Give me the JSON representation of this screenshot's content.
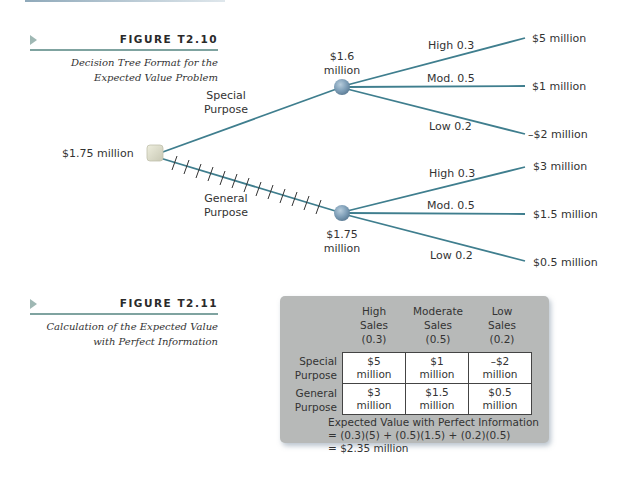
{
  "figure_t2_10": {
    "title": "FIGURE T2.10",
    "caption_line1": "Decision Tree Format for the",
    "caption_line2": "Expected Value Problem"
  },
  "tree": {
    "root_value": "$1.75 million",
    "special": {
      "branch_label_line1": "Special",
      "branch_label_line2": "Purpose",
      "node_value_line1": "$1.6",
      "node_value_line2": "million",
      "outcomes": [
        {
          "prob_label": "High 0.3",
          "payoff": "$5 million"
        },
        {
          "prob_label": "Mod. 0.5",
          "payoff": "$1 million"
        },
        {
          "prob_label": "Low 0.2",
          "payoff": "–$2 million"
        }
      ]
    },
    "general": {
      "branch_label_line1": "General",
      "branch_label_line2": "Purpose",
      "node_value_line1": "$1.75",
      "node_value_line2": "million",
      "outcomes": [
        {
          "prob_label": "High 0.3",
          "payoff": "$3 million"
        },
        {
          "prob_label": "Mod. 0.5",
          "payoff": "$1.5 million"
        },
        {
          "prob_label": "Low 0.2",
          "payoff": "$0.5 million"
        }
      ]
    },
    "colors": {
      "branch": "#3f7e8e",
      "decision_node": "#dcdccc",
      "chance_node": "#7f9fb8"
    }
  },
  "figure_t2_11": {
    "title": "FIGURE T2.11",
    "caption_line1": "Calculation of the Expected Value",
    "caption_line2": "with Perfect Information"
  },
  "evpi_table": {
    "columns": [
      {
        "l1": "High",
        "l2": "Sales",
        "l3": "(0.3)"
      },
      {
        "l1": "Moderate",
        "l2": "Sales",
        "l3": "(0.5)"
      },
      {
        "l1": "Low",
        "l2": "Sales",
        "l3": "(0.2)"
      }
    ],
    "rows": [
      {
        "l1": "Special",
        "l2": "Purpose",
        "cells": [
          {
            "a": "$5",
            "b": "million"
          },
          {
            "a": "$1",
            "b": "million"
          },
          {
            "a": "–$2",
            "b": "million"
          }
        ]
      },
      {
        "l1": "General",
        "l2": "Purpose",
        "cells": [
          {
            "a": "$3",
            "b": "million"
          },
          {
            "a": "$1.5",
            "b": "million"
          },
          {
            "a": "$0.5",
            "b": "million"
          }
        ]
      }
    ],
    "calc_line1": "Expected Value with Perfect Information",
    "calc_line2": "= (0.3)(5) + (0.5)(1.5) + (0.2)(0.5)",
    "calc_line3": "= $2.35 million"
  }
}
